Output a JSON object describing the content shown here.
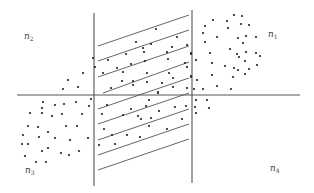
{
  "diagram": {
    "colors": {
      "line": "#555555",
      "dot": "#222222",
      "background": "#ffffff"
    },
    "axes": {
      "horizontal": {
        "x1": 17,
        "y1": 95,
        "x2": 300,
        "y2": 95
      },
      "left_vertical": {
        "x1": 94,
        "y1": 13,
        "x2": 94,
        "y2": 186
      },
      "right_vertical": {
        "x1": 192,
        "y1": 10,
        "x2": 192,
        "y2": 183
      }
    },
    "hatch_lines": [
      {
        "x1": 98,
        "y1": 46,
        "x2": 189,
        "y2": 15
      },
      {
        "x1": 98,
        "y1": 61,
        "x2": 189,
        "y2": 30
      },
      {
        "x1": 98,
        "y1": 77,
        "x2": 189,
        "y2": 46
      },
      {
        "x1": 103,
        "y1": 93,
        "x2": 189,
        "y2": 62
      },
      {
        "x1": 98,
        "y1": 109,
        "x2": 189,
        "y2": 78
      },
      {
        "x1": 98,
        "y1": 124,
        "x2": 189,
        "y2": 93
      },
      {
        "x1": 98,
        "y1": 140,
        "x2": 189,
        "y2": 109
      },
      {
        "x1": 98,
        "y1": 155,
        "x2": 189,
        "y2": 124
      },
      {
        "x1": 98,
        "y1": 170,
        "x2": 189,
        "y2": 139
      }
    ],
    "labels": [
      {
        "id": "n1",
        "base": "n",
        "sub": "1",
        "x": 268,
        "y": 30
      },
      {
        "id": "n2",
        "base": "n",
        "sub": "2",
        "x": 24,
        "y": 32
      },
      {
        "id": "n3",
        "base": "n",
        "sub": "3",
        "x": 25,
        "y": 166
      },
      {
        "id": "n4",
        "base": "n",
        "sub": "4",
        "x": 270,
        "y": 164
      }
    ],
    "points": [
      [
        213,
        20
      ],
      [
        227,
        21
      ],
      [
        234,
        15
      ],
      [
        242,
        16
      ],
      [
        205,
        26
      ],
      [
        228,
        28
      ],
      [
        241,
        24
      ],
      [
        249,
        25
      ],
      [
        203,
        33
      ],
      [
        217,
        37
      ],
      [
        238,
        38
      ],
      [
        246,
        36
      ],
      [
        256,
        37
      ],
      [
        205,
        42
      ],
      [
        243,
        43
      ],
      [
        230,
        49
      ],
      [
        191,
        53
      ],
      [
        210,
        53
      ],
      [
        237,
        54
      ],
      [
        246,
        52
      ],
      [
        256,
        53
      ],
      [
        239,
        57
      ],
      [
        260,
        56
      ],
      [
        196,
        60
      ],
      [
        212,
        63
      ],
      [
        245,
        61
      ],
      [
        225,
        66
      ],
      [
        234,
        68
      ],
      [
        238,
        70
      ],
      [
        257,
        65
      ],
      [
        249,
        69
      ],
      [
        245,
        74
      ],
      [
        212,
        75
      ],
      [
        191,
        76
      ],
      [
        233,
        77
      ],
      [
        197,
        80
      ],
      [
        217,
        86
      ],
      [
        231,
        89
      ],
      [
        203,
        89
      ],
      [
        194,
        89
      ],
      [
        196,
        100
      ],
      [
        207,
        100
      ],
      [
        195,
        107
      ],
      [
        209,
        108
      ],
      [
        196,
        113
      ],
      [
        156,
        29
      ],
      [
        177,
        37
      ],
      [
        136,
        42
      ],
      [
        151,
        44
      ],
      [
        143,
        48
      ],
      [
        187,
        45
      ],
      [
        144,
        52
      ],
      [
        126,
        54
      ],
      [
        167,
        52
      ],
      [
        172,
        47
      ],
      [
        191,
        54
      ],
      [
        108,
        60
      ],
      [
        131,
        64
      ],
      [
        145,
        61
      ],
      [
        168,
        59
      ],
      [
        185,
        63
      ],
      [
        187,
        67
      ],
      [
        117,
        68
      ],
      [
        103,
        73
      ],
      [
        123,
        72
      ],
      [
        147,
        73
      ],
      [
        169,
        73
      ],
      [
        191,
        77
      ],
      [
        122,
        81
      ],
      [
        133,
        81
      ],
      [
        147,
        82
      ],
      [
        162,
        83
      ],
      [
        173,
        78
      ],
      [
        133,
        85
      ],
      [
        111,
        88
      ],
      [
        173,
        87
      ],
      [
        158,
        92
      ],
      [
        187,
        88
      ],
      [
        158,
        93
      ],
      [
        107,
        105
      ],
      [
        102,
        114
      ],
      [
        131,
        109
      ],
      [
        146,
        106
      ],
      [
        149,
        100
      ],
      [
        123,
        115
      ],
      [
        138,
        116
      ],
      [
        141,
        119
      ],
      [
        151,
        118
      ],
      [
        159,
        111
      ],
      [
        175,
        107
      ],
      [
        186,
        106
      ],
      [
        182,
        119
      ],
      [
        104,
        129
      ],
      [
        112,
        135
      ],
      [
        127,
        135
      ],
      [
        149,
        126
      ],
      [
        140,
        137
      ],
      [
        167,
        129
      ],
      [
        99,
        145
      ],
      [
        115,
        144
      ],
      [
        93,
        58
      ],
      [
        95,
        67
      ],
      [
        83,
        73
      ],
      [
        68,
        80
      ],
      [
        78,
        87
      ],
      [
        63,
        89
      ],
      [
        91,
        99
      ],
      [
        43,
        102
      ],
      [
        55,
        105
      ],
      [
        64,
        104
      ],
      [
        76,
        102
      ],
      [
        42,
        108
      ],
      [
        89,
        106
      ],
      [
        30,
        113
      ],
      [
        42,
        113
      ],
      [
        52,
        116
      ],
      [
        62,
        114
      ],
      [
        82,
        114
      ],
      [
        28,
        126
      ],
      [
        38,
        127
      ],
      [
        48,
        132
      ],
      [
        66,
        126
      ],
      [
        77,
        126
      ],
      [
        23,
        135
      ],
      [
        39,
        137
      ],
      [
        55,
        138
      ],
      [
        70,
        140
      ],
      [
        88,
        138
      ],
      [
        22,
        144
      ],
      [
        28,
        144
      ],
      [
        48,
        148
      ],
      [
        42,
        151
      ],
      [
        79,
        151
      ],
      [
        61,
        153
      ],
      [
        69,
        155
      ],
      [
        25,
        156
      ],
      [
        36,
        162
      ],
      [
        46,
        162
      ]
    ]
  }
}
